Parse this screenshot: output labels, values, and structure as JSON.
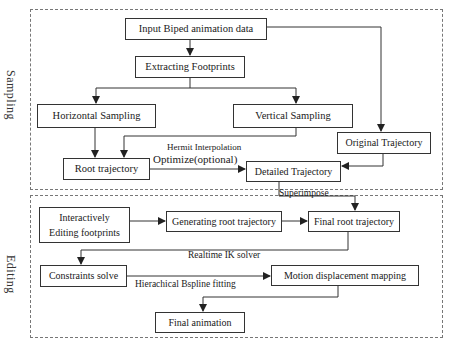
{
  "diagram": {
    "type": "flowchart",
    "colors": {
      "stroke": "#333333",
      "dashed_border": "#777777",
      "text": "#1a1a1a",
      "background": "#ffffff"
    },
    "sections": [
      {
        "id": "sampling",
        "label": "Sampling"
      },
      {
        "id": "editing",
        "label": "Editing"
      }
    ],
    "nodes": {
      "input_biped": "Input Biped animation data",
      "extracting_footprints": "Extracting Footprints",
      "horizontal_sampling": "Horizontal Sampling",
      "vertical_sampling": "Vertical Sampling",
      "original_trajectory": "Original Trajectory",
      "root_trajectory": "Root trajectory",
      "detailed_trajectory": "Detailed Trajectory",
      "interactively_editing_line1": "Interactively",
      "interactively_editing_line2": "Editing footprints",
      "generating_root_trajectory": "Generating root trajectory",
      "final_root_trajectory": "Final root trajectory",
      "constraints_solve": "Constraints solve",
      "motion_displacement_mapping": "Motion displacement mapping",
      "final_animation": "Final animation"
    },
    "edge_labels": {
      "hermit_interpolation": "Hermit Interpolation",
      "optimize_optional": "Optimize(optional)",
      "superimpose": "Superimpose",
      "realtime_ik_solver": "Realtime IK solver",
      "hierarchical_bspline_fitting": "Hierachical Bspline fitting"
    },
    "edges": [
      {
        "from": "Input Biped animation data",
        "to": "Extracting Footprints"
      },
      {
        "from": "Input Biped animation data",
        "to": "Original Trajectory"
      },
      {
        "from": "Extracting Footprints",
        "to": "Horizontal Sampling"
      },
      {
        "from": "Extracting Footprints",
        "to": "Vertical Sampling"
      },
      {
        "from": "Horizontal Sampling",
        "to": "Root trajectory"
      },
      {
        "from": "Vertical Sampling",
        "to": "Root trajectory",
        "label": "Hermit Interpolation"
      },
      {
        "from": "Root trajectory",
        "to": "Detailed Trajectory",
        "label": "Optimize(optional)"
      },
      {
        "from": "Original Trajectory",
        "to": "Detailed Trajectory"
      },
      {
        "from": "Detailed Trajectory",
        "to": "Final root trajectory",
        "label": "Superimpose"
      },
      {
        "from": "Interactively Editing footprints",
        "to": "Generating root trajectory"
      },
      {
        "from": "Generating root trajectory",
        "to": "Final root trajectory"
      },
      {
        "from": "Final root trajectory",
        "to": "Constraints solve",
        "label": "Realtime IK solver"
      },
      {
        "from": "Constraints solve",
        "to": "Motion displacement mapping",
        "label": "Hierachical Bspline fitting"
      },
      {
        "from": "Motion displacement mapping",
        "to": "Final animation"
      }
    ]
  }
}
